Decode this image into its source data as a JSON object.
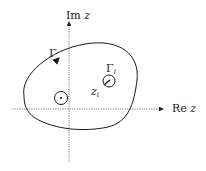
{
  "diagram": {
    "axes": {
      "x_label_prefix": "Re",
      "x_label_var": "z",
      "y_label_prefix": "Im",
      "y_label_var": "z"
    },
    "contours": {
      "outer_label": "Γ",
      "inner_label_main": "Γ",
      "inner_label_sub": "i"
    },
    "points": {
      "pole_label_main": "z",
      "pole_label_sub": "i"
    },
    "colors": {
      "stroke": "#1a1a1a",
      "axis": "#555555",
      "background": "#ffffff"
    }
  }
}
